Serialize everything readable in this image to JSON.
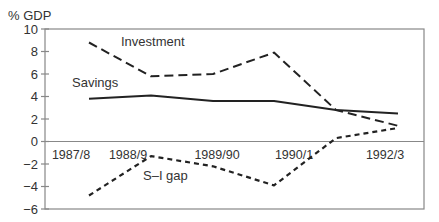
{
  "chart_data": {
    "type": "line",
    "title": "",
    "ylabel": "% GDP",
    "xlabel": "",
    "ylim": [
      -6,
      10
    ],
    "yticks": [
      10,
      8,
      6,
      4,
      2,
      0,
      -2,
      -4,
      -6
    ],
    "ytick_labels": [
      "10",
      "8",
      "6",
      "4",
      "2",
      "0",
      "−2",
      "−4",
      "−6"
    ],
    "x": [
      "1987/8",
      "1988/9",
      "1989/90",
      "1990/1",
      "1991/2",
      "1992/3"
    ],
    "xtick_labels": [
      "1987/8",
      "1988/9",
      "1989/90",
      "1990/1",
      "1992/3"
    ],
    "grid": false,
    "legend": "inline labels",
    "series": [
      {
        "name": "Investment",
        "style": "long-dash",
        "values": [
          8.8,
          5.8,
          6.0,
          7.9,
          2.8,
          1.4
        ]
      },
      {
        "name": "Savings",
        "style": "solid",
        "values": [
          3.8,
          4.1,
          3.6,
          3.6,
          2.8,
          2.5
        ]
      },
      {
        "name": "S–I gap",
        "style": "short-dash",
        "values": [
          -4.8,
          -1.3,
          -2.2,
          -3.9,
          0.3,
          1.2
        ]
      }
    ],
    "annotations": [
      {
        "text": "Investment",
        "near_series": "Investment"
      },
      {
        "text": "Savings",
        "near_series": "Savings"
      },
      {
        "text": "S–I gap",
        "near_series": "S–I gap"
      }
    ]
  }
}
